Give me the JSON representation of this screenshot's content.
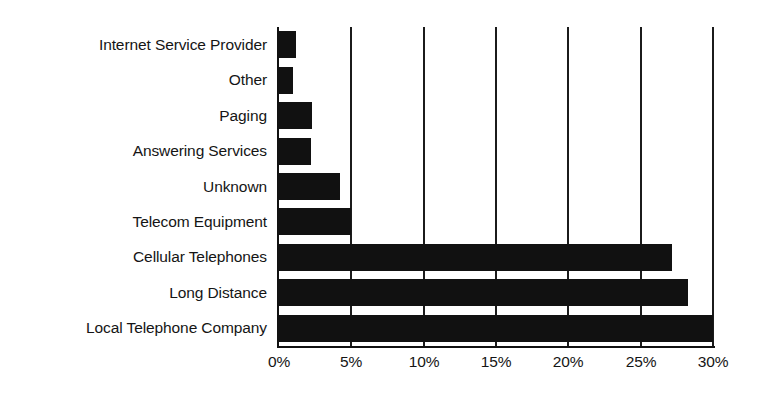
{
  "chart_data": {
    "type": "bar",
    "orientation": "horizontal",
    "title": "",
    "subtitle": "",
    "xlabel": "",
    "ylabel": "",
    "categories": [
      "Internet Service Provider",
      "Other",
      "Paging",
      "Answering Services",
      "Unknown",
      "Telecom Equipment",
      "Cellular Telephones",
      "Long Distance",
      "Local Telephone Company"
    ],
    "values": [
      1.2,
      1.0,
      2.3,
      2.2,
      4.2,
      5.0,
      27.2,
      28.3,
      30.0
    ],
    "value_format": "percent",
    "xlim": [
      0,
      30
    ],
    "xticks": [
      0,
      5,
      10,
      15,
      20,
      25,
      30
    ],
    "xtick_labels": [
      "0%",
      "5%",
      "10%",
      "15%",
      "20%",
      "25%",
      "30%"
    ],
    "grid": "vertical",
    "legend": "none",
    "bar_color": "#111111",
    "background_color": "#ffffff",
    "axis_color": "#111111"
  },
  "axis": {
    "x_ticks": [
      {
        "label": "0%",
        "value": 0
      },
      {
        "label": "5%",
        "value": 5
      },
      {
        "label": "10%",
        "value": 10
      },
      {
        "label": "15%",
        "value": 15
      },
      {
        "label": "20%",
        "value": 20
      },
      {
        "label": "25%",
        "value": 25
      },
      {
        "label": "30%",
        "value": 30
      }
    ]
  }
}
